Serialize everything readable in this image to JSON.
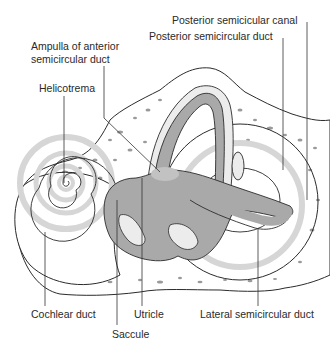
{
  "figure": {
    "title_faint_line1": "",
    "title_faint_line2": "",
    "labels": {
      "posterior_canal": "Posterior semicicular canal",
      "posterior_duct": "Posterior semicircular duct",
      "ampulla_line1": "Ampulla of anterior",
      "ampulla_line2": "semicircular duct",
      "helicotrema": "Helicotrema",
      "cochlear_duct": "Cochlear duct",
      "saccule": "Saccule",
      "utricle": "Utricle",
      "lateral_duct": "Lateral semicircular duct"
    },
    "caption_faint": ""
  },
  "colors": {
    "outline": "#2b2b2b",
    "duct": "#a9a9a9",
    "band": "#d6d6d6",
    "bone_speck": "#9a9a9a",
    "pale": "#ececec",
    "leader": "#333333"
  }
}
